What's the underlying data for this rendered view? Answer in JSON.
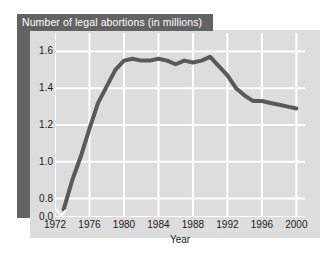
{
  "chart_data": {
    "type": "line",
    "title": "Number of legal abortions (in millions)",
    "xlabel": "Year",
    "ylabel": "",
    "xlim": [
      1972,
      2001
    ],
    "ylim": [
      0.7,
      1.7
    ],
    "yaxis_break": true,
    "grid": true,
    "legend": "none",
    "line_color": "#595959",
    "plot_background": "#dddddd",
    "grid_color": "#ffffff",
    "title_band_color": "#636363",
    "title_text_color": "#ffffff",
    "x_ticks": [
      "1972",
      "1976",
      "1980",
      "1984",
      "1988",
      "1992",
      "1996",
      "2000"
    ],
    "x_tick_values": [
      1972,
      1976,
      1980,
      1984,
      1988,
      1992,
      1996,
      2000
    ],
    "y_ticks": [
      "0.0",
      "0.8",
      "1.0",
      "1.2",
      "1.4",
      "1.6"
    ],
    "y_tick_values": [
      0.7,
      0.8,
      1.0,
      1.2,
      1.4,
      1.6
    ],
    "x": [
      1973,
      1974,
      1975,
      1976,
      1977,
      1978,
      1979,
      1980,
      1981,
      1982,
      1983,
      1984,
      1985,
      1986,
      1987,
      1988,
      1989,
      1990,
      1991,
      1992,
      1993,
      1994,
      1995,
      1996,
      1997,
      1998,
      1999,
      2000
    ],
    "values": [
      0.74,
      0.9,
      1.03,
      1.18,
      1.32,
      1.41,
      1.5,
      1.55,
      1.56,
      1.55,
      1.55,
      1.56,
      1.55,
      1.53,
      1.55,
      1.54,
      1.55,
      1.57,
      1.52,
      1.47,
      1.4,
      1.36,
      1.33,
      1.33,
      1.32,
      1.31,
      1.3,
      1.29
    ],
    "series_name": "Legal abortions (millions)"
  },
  "axis": {
    "x_title": "Year"
  }
}
